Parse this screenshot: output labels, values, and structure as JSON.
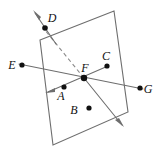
{
  "figure": {
    "width": 168,
    "height": 153,
    "background_color": "#ffffff",
    "line_color": "#6e6e6e",
    "dashed_line_color": "#8a8a8a",
    "point_color": "#111111",
    "label_font_style": "italic-serif"
  },
  "plane": {
    "name": "quadrilateral-plane",
    "vertices": [
      {
        "x": 40,
        "y": 40
      },
      {
        "x": 114,
        "y": 11
      },
      {
        "x": 128,
        "y": 112
      },
      {
        "x": 53,
        "y": 145
      }
    ],
    "fill": "#ffffff",
    "stroke": "#6e6e6e"
  },
  "points": [
    {
      "id": "A",
      "label": "A",
      "dot": {
        "x": 64,
        "y": 87
      },
      "label_pos": {
        "x": 61,
        "y": 100
      },
      "inside_plane": true
    },
    {
      "id": "B",
      "label": "B",
      "dot": {
        "x": 89,
        "y": 108
      },
      "label_pos": {
        "x": 74,
        "y": 114
      },
      "inside_plane": true
    },
    {
      "id": "C",
      "label": "C",
      "dot": {
        "x": 107,
        "y": 66
      },
      "label_pos": {
        "x": 103,
        "y": 60
      },
      "inside_plane": true
    },
    {
      "id": "D",
      "label": "D",
      "dot": {
        "x": 45,
        "y": 28
      },
      "label_pos": {
        "x": 49,
        "y": 22
      },
      "inside_plane": false
    },
    {
      "id": "E",
      "label": "E",
      "dot": {
        "x": 22,
        "y": 65
      },
      "label_pos": {
        "x": 9,
        "y": 69
      },
      "inside_plane": false
    },
    {
      "id": "F",
      "label": "F",
      "dot": {
        "x": 84,
        "y": 78
      },
      "label_pos": {
        "x": 82,
        "y": 71
      },
      "inside_plane": true
    },
    {
      "id": "G",
      "label": "G",
      "dot": {
        "x": 140,
        "y": 88
      },
      "label_pos": {
        "x": 144,
        "y": 93
      },
      "inside_plane": false
    }
  ],
  "lines": [
    {
      "id": "line-EFG",
      "style": "solid",
      "from": {
        "x": 19,
        "y": 64
      },
      "to": {
        "x": 143,
        "y": 89
      },
      "passes_through": [
        "E",
        "F",
        "G"
      ],
      "arrows": []
    },
    {
      "id": "line-CF-arrow",
      "style": "solid",
      "from": {
        "x": 108,
        "y": 66
      },
      "to": {
        "x": 46,
        "y": 93
      },
      "passes_through": [
        "C",
        "F"
      ],
      "arrows": [
        "to"
      ]
    },
    {
      "id": "line-F-down-right-arrow",
      "style": "solid",
      "from": {
        "x": 84,
        "y": 78
      },
      "to": {
        "x": 124,
        "y": 127
      },
      "passes_through": [
        "F"
      ],
      "arrows": [
        "to"
      ]
    },
    {
      "id": "line-DF-dashed",
      "style": "dashed",
      "from": {
        "x": 84,
        "y": 78
      },
      "to": {
        "x": 44,
        "y": 29
      },
      "passes_through": [
        "F",
        "D"
      ],
      "arrows": []
    },
    {
      "id": "line-D-up-left-arrow",
      "style": "solid",
      "from": {
        "x": 52,
        "y": 38
      },
      "to": {
        "x": 33,
        "y": 10
      },
      "passes_through": [
        "D"
      ],
      "arrows": [
        "to"
      ]
    }
  ],
  "arrowheads": [
    {
      "id": "arrow-upper-left",
      "tip": {
        "x": 33,
        "y": 10
      },
      "angle_deg": 236
    },
    {
      "id": "arrow-lower-left",
      "tip": {
        "x": 46,
        "y": 93
      },
      "angle_deg": 157
    },
    {
      "id": "arrow-lower-right",
      "tip": {
        "x": 124,
        "y": 127
      },
      "angle_deg": 51
    }
  ]
}
